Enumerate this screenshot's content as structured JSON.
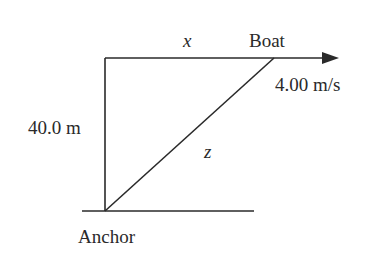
{
  "diagram": {
    "type": "related-rates geometry",
    "labels": {
      "horizontal_distance": "x",
      "boat": "Boat",
      "speed": "4.00 m/s",
      "depth": "40.0 m",
      "hypotenuse": "z",
      "anchor": "Anchor"
    },
    "colors": {
      "line": "#2a2a2a",
      "background": "#ffffff"
    }
  }
}
